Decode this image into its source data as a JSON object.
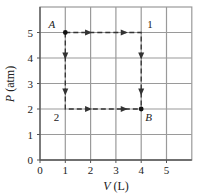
{
  "chart_data": {
    "type": "line",
    "title": "",
    "xlabel": "V (L)",
    "ylabel": "P (atm)",
    "xlabel_var": "V",
    "xlabel_unit": " (L)",
    "ylabel_var": "P",
    "ylabel_unit": " (atm)",
    "xlim": [
      0,
      6
    ],
    "ylim": [
      0,
      6
    ],
    "grid": true,
    "x_ticks": [
      0,
      1,
      2,
      3,
      4,
      5
    ],
    "y_ticks": [
      0,
      1,
      2,
      3,
      4,
      5
    ],
    "points": [
      {
        "name": "A",
        "x": 1,
        "y": 5,
        "marker": true,
        "italic": true,
        "label_pos": "upper-left"
      },
      {
        "name": "1",
        "x": 4,
        "y": 5,
        "marker": false,
        "italic": false,
        "label_pos": "upper-right"
      },
      {
        "name": "B",
        "x": 4,
        "y": 2,
        "marker": true,
        "italic": true,
        "label_pos": "lower-right"
      },
      {
        "name": "2",
        "x": 1,
        "y": 2,
        "marker": false,
        "italic": false,
        "label_pos": "lower-left"
      }
    ],
    "series": [
      {
        "name": "path A-1-B",
        "x": [
          1,
          4,
          4
        ],
        "y": [
          5,
          5,
          2
        ],
        "style": "dashed",
        "arrows": "forward"
      },
      {
        "name": "path A-2-B",
        "x": [
          1,
          1,
          4
        ],
        "y": [
          5,
          2,
          2
        ],
        "style": "dashed",
        "arrows": "forward"
      }
    ],
    "colors": {
      "grid": "#9a9a9a",
      "frame": "#555555",
      "path": "#333333",
      "text": "#222222"
    }
  }
}
